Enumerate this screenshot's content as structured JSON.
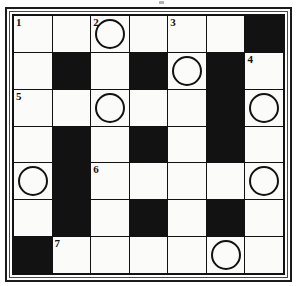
{
  "puzzle": {
    "title": "",
    "rows": 7,
    "columns": 7,
    "ink_color": "#121212",
    "cell_color": "#fbfbfa",
    "block_color": "#121212",
    "grid": [
      [
        {
          "type": "white",
          "number": "1",
          "circled": false,
          "letter": ""
        },
        {
          "type": "white",
          "number": "",
          "circled": false,
          "letter": ""
        },
        {
          "type": "white",
          "number": "2",
          "circled": true,
          "letter": ""
        },
        {
          "type": "white",
          "number": "",
          "circled": false,
          "letter": ""
        },
        {
          "type": "white",
          "number": "3",
          "circled": false,
          "letter": ""
        },
        {
          "type": "white",
          "number": "",
          "circled": false,
          "letter": ""
        },
        {
          "type": "block",
          "number": "",
          "circled": false,
          "letter": ""
        }
      ],
      [
        {
          "type": "white",
          "number": "",
          "circled": false,
          "letter": ""
        },
        {
          "type": "block",
          "number": "",
          "circled": false,
          "letter": ""
        },
        {
          "type": "white",
          "number": "",
          "circled": false,
          "letter": ""
        },
        {
          "type": "block",
          "number": "",
          "circled": false,
          "letter": ""
        },
        {
          "type": "white",
          "number": "",
          "circled": true,
          "letter": ""
        },
        {
          "type": "block",
          "number": "",
          "circled": false,
          "letter": ""
        },
        {
          "type": "white",
          "number": "4",
          "circled": false,
          "letter": ""
        }
      ],
      [
        {
          "type": "white",
          "number": "5",
          "circled": false,
          "letter": ""
        },
        {
          "type": "white",
          "number": "",
          "circled": false,
          "letter": ""
        },
        {
          "type": "white",
          "number": "",
          "circled": true,
          "letter": ""
        },
        {
          "type": "white",
          "number": "",
          "circled": false,
          "letter": ""
        },
        {
          "type": "white",
          "number": "",
          "circled": false,
          "letter": ""
        },
        {
          "type": "block",
          "number": "",
          "circled": false,
          "letter": ""
        },
        {
          "type": "white",
          "number": "",
          "circled": true,
          "letter": ""
        }
      ],
      [
        {
          "type": "white",
          "number": "",
          "circled": false,
          "letter": ""
        },
        {
          "type": "block",
          "number": "",
          "circled": false,
          "letter": ""
        },
        {
          "type": "white",
          "number": "",
          "circled": false,
          "letter": ""
        },
        {
          "type": "block",
          "number": "",
          "circled": false,
          "letter": ""
        },
        {
          "type": "white",
          "number": "",
          "circled": false,
          "letter": ""
        },
        {
          "type": "block",
          "number": "",
          "circled": false,
          "letter": ""
        },
        {
          "type": "white",
          "number": "",
          "circled": false,
          "letter": ""
        }
      ],
      [
        {
          "type": "white",
          "number": "",
          "circled": true,
          "letter": ""
        },
        {
          "type": "block",
          "number": "",
          "circled": false,
          "letter": ""
        },
        {
          "type": "white",
          "number": "6",
          "circled": false,
          "letter": ""
        },
        {
          "type": "white",
          "number": "",
          "circled": false,
          "letter": ""
        },
        {
          "type": "white",
          "number": "",
          "circled": false,
          "letter": ""
        },
        {
          "type": "white",
          "number": "",
          "circled": false,
          "letter": ""
        },
        {
          "type": "white",
          "number": "",
          "circled": true,
          "letter": ""
        }
      ],
      [
        {
          "type": "white",
          "number": "",
          "circled": false,
          "letter": ""
        },
        {
          "type": "block",
          "number": "",
          "circled": false,
          "letter": ""
        },
        {
          "type": "white",
          "number": "",
          "circled": false,
          "letter": ""
        },
        {
          "type": "block",
          "number": "",
          "circled": false,
          "letter": ""
        },
        {
          "type": "white",
          "number": "",
          "circled": false,
          "letter": ""
        },
        {
          "type": "block",
          "number": "",
          "circled": false,
          "letter": ""
        },
        {
          "type": "white",
          "number": "",
          "circled": false,
          "letter": ""
        }
      ],
      [
        {
          "type": "block",
          "number": "",
          "circled": false,
          "letter": ""
        },
        {
          "type": "white",
          "number": "7",
          "circled": false,
          "letter": ""
        },
        {
          "type": "white",
          "number": "",
          "circled": false,
          "letter": ""
        },
        {
          "type": "white",
          "number": "",
          "circled": false,
          "letter": ""
        },
        {
          "type": "white",
          "number": "",
          "circled": false,
          "letter": ""
        },
        {
          "type": "white",
          "number": "",
          "circled": true,
          "letter": ""
        },
        {
          "type": "white",
          "number": "",
          "circled": false,
          "letter": ""
        }
      ]
    ]
  }
}
